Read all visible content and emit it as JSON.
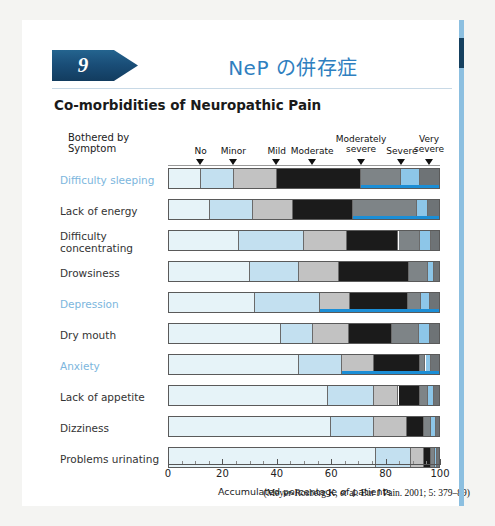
{
  "slide": {
    "number": "9",
    "title": "NeP の併存症",
    "subtitle": "Co-morbidities of Neuropathic Pain",
    "citation": "(Meyer-Rosberg K, et al. Eur J Pain. 2001; 5: 379–89)"
  },
  "colors": {
    "accent_blue": "#2f7fbf",
    "banner_navy": "#1a4e78",
    "highlight_label": "#7cb6dd",
    "underline_blue": "#1b8ed6",
    "seg_no": "#e6f3f8",
    "seg_minor": "#c3e0f0",
    "seg_mild": "#c2c2c2",
    "seg_moderate": "#1b1b1b",
    "seg_moderately_severe": "#7e8487",
    "seg_severe": "#8dc6e8",
    "seg_very_severe": "#6e7376"
  },
  "chart_data": {
    "type": "bar",
    "subtype": "stacked-horizontal-100pct",
    "title": "Co-morbidities of Neuropathic Pain",
    "xlabel": "Accumulated percentage of patients",
    "ylabel": "Bothered by Symptom",
    "xlim": [
      0,
      100
    ],
    "xticks": [
      0,
      20,
      40,
      60,
      80,
      100
    ],
    "xtick_labels": [
      "0",
      "20",
      "40",
      "60",
      "80",
      "100"
    ],
    "grid": false,
    "legend_position": "top",
    "legend_style": "arrow-markers-above-first-bar",
    "legend": [
      {
        "label": "No",
        "marker_at": 12,
        "color": "#e6f3f8"
      },
      {
        "label": "Minor",
        "marker_at": 24,
        "color": "#c3e0f0"
      },
      {
        "label": "Mild",
        "marker_at": 40,
        "color": "#c2c2c2"
      },
      {
        "label": "Moderate",
        "marker_at": 53,
        "color": "#1b1b1b"
      },
      {
        "label": "Moderately severe",
        "marker_at": 71,
        "color": "#7e8487"
      },
      {
        "label": "Severe",
        "marker_at": 86,
        "color": "#8dc6e8"
      },
      {
        "label": "Very severe",
        "marker_at": 96,
        "color": "#6e7376"
      }
    ],
    "categories": [
      "No",
      "Minor",
      "Mild",
      "Moderate",
      "Moderately severe",
      "Severe",
      "Very severe"
    ],
    "rows": [
      {
        "label": "Difficulty sleeping",
        "highlight": true,
        "underline": {
          "from": 71,
          "to": 100
        },
        "values": [
          12,
          12,
          16,
          31,
          15,
          7,
          7
        ]
      },
      {
        "label": "Lack of energy",
        "highlight": false,
        "underline": {
          "from": 68,
          "to": 100
        },
        "values": [
          15,
          16,
          15,
          22,
          24,
          4,
          4
        ]
      },
      {
        "label": "Difficulty concentrating",
        "highlight": false,
        "underline": null,
        "values": [
          26,
          24,
          16,
          19,
          8,
          4,
          3
        ]
      },
      {
        "label": "Drowsiness",
        "highlight": false,
        "underline": null,
        "values": [
          30,
          18,
          15,
          26,
          7,
          2,
          2
        ]
      },
      {
        "label": "Depression",
        "highlight": true,
        "underline": {
          "from": 56,
          "to": 100
        },
        "values": [
          32,
          24,
          11,
          21.5,
          5,
          3,
          3.5
        ]
      },
      {
        "label": "Dry mouth",
        "highlight": false,
        "underline": null,
        "values": [
          41.5,
          12,
          13,
          16,
          10,
          4,
          3.5
        ]
      },
      {
        "label": "Anxiety",
        "highlight": true,
        "underline": {
          "from": 64,
          "to": 100
        },
        "values": [
          48,
          16,
          12,
          17,
          2,
          2,
          3
        ]
      },
      {
        "label": "Lack of appetite",
        "highlight": false,
        "underline": null,
        "values": [
          59,
          17,
          9,
          8,
          3,
          2,
          2
        ]
      },
      {
        "label": "Dizziness",
        "highlight": false,
        "underline": null,
        "values": [
          60,
          16,
          12,
          6.5,
          2.5,
          2,
          1
        ]
      },
      {
        "label": "Problems urinating",
        "highlight": false,
        "underline": null,
        "values": [
          76.5,
          13,
          5,
          2.5,
          1.5,
          0.8,
          0.7
        ]
      }
    ]
  }
}
